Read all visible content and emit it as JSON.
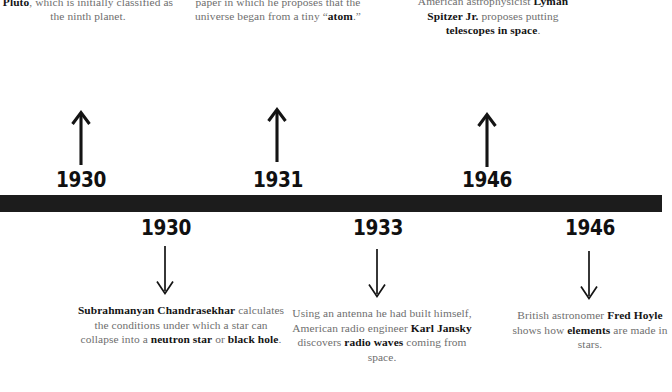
{
  "figure": {
    "type": "timeline",
    "orientation": "horizontal",
    "bar_color": "#1c1c1c",
    "text_color": "#6e6e6e",
    "emphasis_color": "#141414",
    "background": "#ffffff"
  },
  "entries_above": [
    {
      "year": "1930",
      "arrow": "arrow-up-icon",
      "text_parts": [
        {
          "t": "At the Lowell Observatory in Arizona, ",
          "b": false
        },
        {
          "t": "Clyde Tombaugh",
          "b": true
        },
        {
          "t": " discovers ",
          "b": false
        },
        {
          "t": "Pluto",
          "b": true
        },
        {
          "t": ", which is initially classified as the ninth planet.",
          "b": false
        }
      ]
    },
    {
      "year": "1931",
      "arrow": "arrow-up-icon",
      "text_parts": [
        {
          "t": "Georges Lemaitre",
          "b": true
        },
        {
          "t": " publishes a paper in which he proposes that the universe began from a tiny “",
          "b": false
        },
        {
          "t": "atom",
          "b": true
        },
        {
          "t": ".”",
          "b": false
        }
      ]
    },
    {
      "year": "1946",
      "arrow": "arrow-up-icon",
      "text_parts": [
        {
          "t": "American astrophysicist ",
          "b": false
        },
        {
          "t": "Lyman Spitzer Jr.",
          "b": true
        },
        {
          "t": " proposes putting ",
          "b": false
        },
        {
          "t": "telescopes in space",
          "b": true
        },
        {
          "t": ".",
          "b": false
        }
      ]
    }
  ],
  "entries_below": [
    {
      "year": "1930",
      "arrow": "arrow-down-icon",
      "text_parts": [
        {
          "t": "Subrahmanyan Chandrasekhar",
          "b": true
        },
        {
          "t": " calculates the conditions under which a star can collapse into a ",
          "b": false
        },
        {
          "t": "neutron star",
          "b": true
        },
        {
          "t": " or ",
          "b": false
        },
        {
          "t": "black hole",
          "b": true
        },
        {
          "t": ".",
          "b": false
        }
      ]
    },
    {
      "year": "1933",
      "arrow": "arrow-down-icon",
      "text_parts": [
        {
          "t": "Using an antenna he had built himself, American radio engineer ",
          "b": false
        },
        {
          "t": "Karl Jansky",
          "b": true
        },
        {
          "t": " discovers ",
          "b": false
        },
        {
          "t": "radio waves",
          "b": true
        },
        {
          "t": " coming from space.",
          "b": false
        }
      ]
    },
    {
      "year": "1946",
      "arrow": "arrow-down-icon",
      "text_parts": [
        {
          "t": "British astronomer ",
          "b": false
        },
        {
          "t": "Fred Hoyle",
          "b": true
        },
        {
          "t": " shows how ",
          "b": false
        },
        {
          "t": "elements",
          "b": true
        },
        {
          "t": " are made in stars.",
          "b": false
        }
      ]
    }
  ]
}
